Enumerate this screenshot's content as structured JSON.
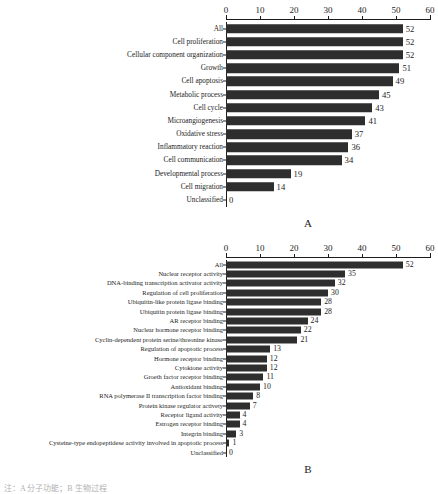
{
  "figure": {
    "caption_partial": "注：A 分子功能；B 生物过程"
  },
  "chart_data": [
    {
      "type": "bar",
      "orientation": "horizontal",
      "panel": "A",
      "title": "",
      "xlabel": "",
      "ylabel": "",
      "xlim": [
        0,
        60
      ],
      "xticks": [
        0,
        10,
        20,
        30,
        40,
        50,
        60
      ],
      "grid": false,
      "legend": "none",
      "bar_color": "#2e2e2e",
      "categories": [
        "All",
        "Cell proliferation",
        "Cellular component organization",
        "Growth",
        "Cell apoptosis",
        "Metabolic process",
        "Cell cycle",
        "Microangiogenesis",
        "Oxidative stress",
        "Inflammatory reaction",
        "Cell communication",
        "Developmental process",
        "Cell migration",
        "Unclassified"
      ],
      "values": [
        52,
        52,
        52,
        51,
        49,
        45,
        43,
        41,
        37,
        36,
        34,
        19,
        14,
        0
      ]
    },
    {
      "type": "bar",
      "orientation": "horizontal",
      "panel": "B",
      "title": "",
      "xlabel": "",
      "ylabel": "",
      "xlim": [
        0,
        60
      ],
      "xticks": [
        0,
        10,
        20,
        30,
        40,
        50,
        60
      ],
      "grid": false,
      "legend": "none",
      "bar_color": "#2e2e2e",
      "categories": [
        "All",
        "Nuclear receptor activity",
        "DNA-binding transcription activator activity",
        "Regulation of cell proliferation",
        "Ubiquitin-like protein ligase binding",
        "Ubiquitin protein ligase binding",
        "AR receptor binding",
        "Nuclear hormone receptor binding",
        "Cyclin-dependent protein serine/threonine kinase",
        "Regulation of apoptotic process",
        "Hormone receptor binding",
        "Cytokione activity",
        "Groeth factor receptor binding",
        "Antioxidant binding",
        "RNA polymerase II transcription factor binding",
        "Protein kinase regulator activety",
        "Receptor ligand activity",
        "Estrogen receptor binding",
        "Integrin binding",
        "Cysteine-type endopeptidese activity involved in apoptotic process",
        "Unclassified"
      ],
      "values": [
        52,
        35,
        32,
        30,
        28,
        28,
        24,
        22,
        21,
        13,
        12,
        12,
        11,
        10,
        8,
        7,
        4,
        4,
        3,
        1,
        0
      ]
    }
  ]
}
